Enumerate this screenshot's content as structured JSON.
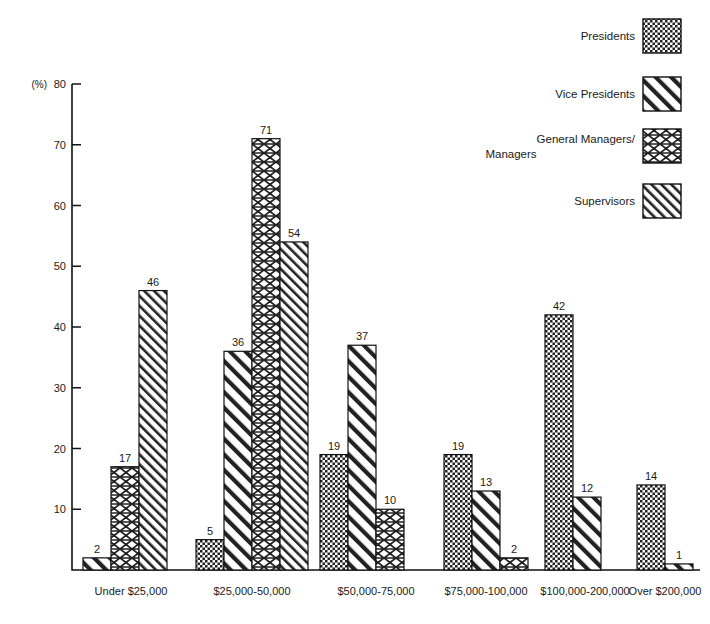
{
  "chart_data": {
    "type": "bar",
    "title": "",
    "subtitle": "",
    "xlabel": "",
    "ylabel": "(%)",
    "ylim": [
      0,
      80
    ],
    "yticks": [
      0,
      10,
      20,
      30,
      40,
      50,
      60,
      70,
      80
    ],
    "ytick_labels": [
      "",
      "10",
      "20",
      "30",
      "40",
      "50",
      "60",
      "70",
      "80"
    ],
    "y_unit_label": "(%)",
    "grid": false,
    "legend_position": "top-right",
    "categories": [
      "Under $25,000",
      "$25,000-50,000",
      "$50,000-75,000",
      "$75,000-100,000",
      "$100,000-200,000",
      "Over $200,000"
    ],
    "series": [
      {
        "name": "Presidents",
        "pattern": "fine-checker",
        "values": [
          null,
          5,
          19,
          19,
          42,
          14
        ]
      },
      {
        "name": "Vice Presidents",
        "pattern": "wide-diagonal",
        "values": [
          2,
          36,
          37,
          13,
          12,
          1
        ]
      },
      {
        "name": "General Managers/Managers",
        "pattern": "diamond-lattice",
        "values": [
          17,
          71,
          10,
          2,
          null,
          null
        ]
      },
      {
        "name": "Supervisors",
        "pattern": "narrow-diagonal",
        "values": [
          46,
          54,
          null,
          null,
          null,
          null
        ]
      }
    ]
  },
  "legend": {
    "items": [
      {
        "label": "Presidents",
        "pattern": "fine-checker"
      },
      {
        "label": "Vice Presidents",
        "pattern": "wide-diagonal"
      },
      {
        "label": "General Managers/",
        "label2": "Managers",
        "pattern": "diamond-lattice"
      },
      {
        "label": "Supervisors",
        "pattern": "narrow-diagonal"
      }
    ]
  },
  "colors": {
    "ink": "#111111",
    "paper": "#ffffff"
  }
}
